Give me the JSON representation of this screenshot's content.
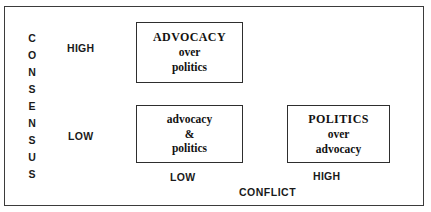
{
  "diagram": {
    "y_axis": {
      "name": "CONSENSUS",
      "letters": [
        "C",
        "O",
        "N",
        "S",
        "E",
        "N",
        "S",
        "U",
        "S"
      ],
      "levels": {
        "high": "HIGH",
        "low": "LOW"
      }
    },
    "x_axis": {
      "name": "CONFLICT",
      "levels": {
        "low": "LOW",
        "high": "HIGH"
      }
    },
    "quadrants": [
      {
        "id": "advocacy-over-politics",
        "consensus": "HIGH",
        "conflict": "LOW",
        "line1": "ADVOCACY",
        "line2": "over",
        "line3": "politics"
      },
      {
        "id": "advocacy-and-politics",
        "consensus": "LOW",
        "conflict": "LOW",
        "line1": "advocacy",
        "line2": "&",
        "line3": "politics"
      },
      {
        "id": "politics-over-advocacy",
        "consensus": "LOW",
        "conflict": "HIGH",
        "line1": "POLITICS",
        "line2": "over",
        "line3": "advocacy"
      }
    ],
    "colors": {
      "frame_border": "#3b3b3b",
      "box_border": "#2e2e2e",
      "text": "#1a1a1a",
      "background": "#ffffff"
    }
  }
}
